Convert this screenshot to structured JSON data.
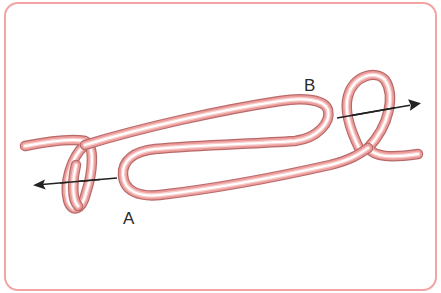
{
  "diagram": {
    "labels": {
      "a": "A",
      "b": "B"
    },
    "arrows": [
      {
        "name": "pull-left",
        "direction": "left"
      },
      {
        "name": "pull-right",
        "direction": "right"
      }
    ],
    "colors": {
      "frame_border": "#f2a3a3",
      "rope_outline": "#b86a6a",
      "rope_body": "#ec9d9b",
      "rope_highlight": "#ffffff",
      "arrow": "#222222",
      "label_text": "#2a2a2a"
    }
  }
}
